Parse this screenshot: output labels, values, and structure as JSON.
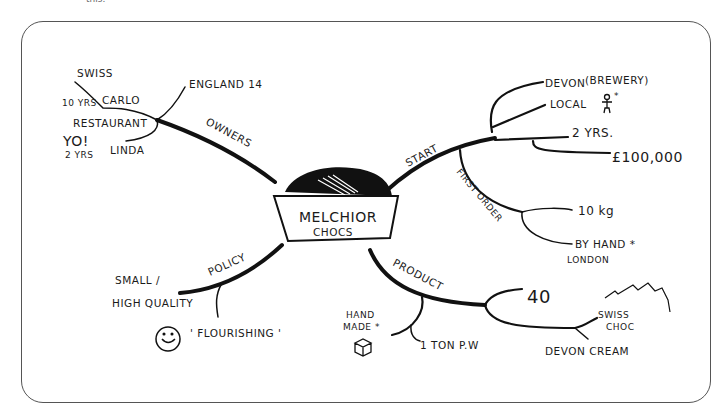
{
  "caption_fragment": "this.",
  "mind_map": {
    "center": {
      "line1": "MELCHIOR",
      "line2": "CHOCS",
      "icon": "chocolate-box-icon"
    },
    "branches": {
      "owners": {
        "label": "OWNERS",
        "children": {
          "england": "ENGLAND 14",
          "carlo": "CARLO",
          "carlo_swiss": "SWISS",
          "carlo_years": "10 YRS",
          "restaurant": "RESTAURANT",
          "linda": "LINDA",
          "linda_yo": "YO!",
          "linda_years": "2 YRS"
        }
      },
      "start": {
        "label": "START",
        "children": {
          "devon": "DEVON",
          "brewery": "(BREWERY)",
          "local": "LOCAL",
          "local_mark": "*",
          "years": "2 YRS.",
          "money": "£100,000"
        }
      },
      "first_order": {
        "label": "FIRST ORDER",
        "children": {
          "weight": "10 kg",
          "by_hand": "BY HAND *",
          "london": "LONDON"
        }
      },
      "product": {
        "label": "PRODUCT",
        "children": {
          "count": "40",
          "swiss_choc_1": "SWISS",
          "swiss_choc_2": "CHOC",
          "devon_cream": "DEVON CREAM",
          "hand_1": "HAND",
          "hand_2": "MADE *",
          "ton": "1 TON P.W"
        }
      },
      "policy": {
        "label": "POLICY",
        "children": {
          "small": "SMALL /",
          "quality": "HIGH QUALITY",
          "flourishing": "' FLOURISHING '"
        }
      }
    }
  }
}
